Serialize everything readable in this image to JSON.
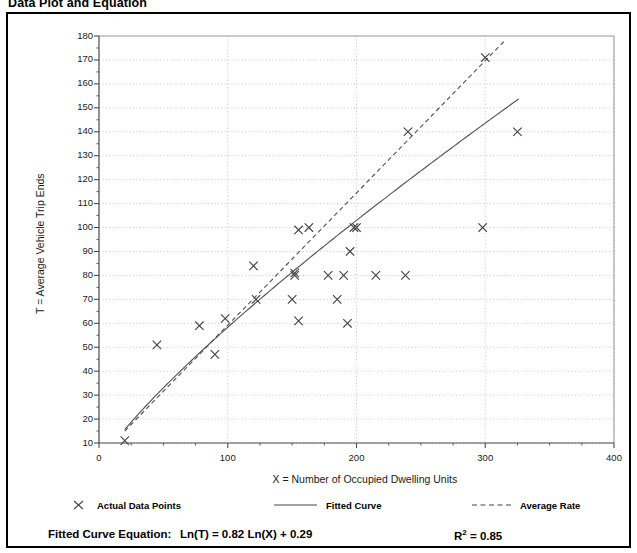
{
  "title": "Data Plot and Equation",
  "chart_data": {
    "type": "scatter",
    "title": "Data Plot and Equation",
    "xlabel": "X = Number of Occupied Dwelling Units",
    "ylabel": "T = Average Vehicle Trip Ends",
    "xlim": [
      0,
      400
    ],
    "ylim": [
      10,
      180
    ],
    "x_ticks": [
      0,
      100,
      200,
      300,
      400
    ],
    "x_minor_step": 25,
    "y_ticks": [
      10,
      20,
      30,
      40,
      50,
      60,
      70,
      80,
      90,
      100,
      110,
      120,
      130,
      140,
      150,
      160,
      170,
      180
    ],
    "y_minor_step": 5,
    "grid": "dotted-both",
    "legend_position": "below-plot",
    "series": [
      {
        "name": "Actual Data Points",
        "marker": "x",
        "points": [
          [
            20,
            11
          ],
          [
            45,
            51
          ],
          [
            78,
            59
          ],
          [
            90,
            47
          ],
          [
            98,
            62
          ],
          [
            120,
            84
          ],
          [
            122,
            70
          ],
          [
            150,
            70
          ],
          [
            152,
            81
          ],
          [
            152,
            80
          ],
          [
            155,
            99
          ],
          [
            163,
            100
          ],
          [
            155,
            61
          ],
          [
            178,
            80
          ],
          [
            185,
            70
          ],
          [
            190,
            80
          ],
          [
            193,
            60
          ],
          [
            195,
            90
          ],
          [
            198,
            100
          ],
          [
            200,
            100
          ],
          [
            215,
            80
          ],
          [
            238,
            80
          ],
          [
            240,
            140
          ],
          [
            298,
            100
          ],
          [
            300,
            171
          ],
          [
            325,
            140
          ]
        ]
      },
      {
        "name": "Fitted Curve",
        "style": "solid",
        "equation": "Ln(T) = 0.82 Ln(X) + 0.29",
        "a": 0.82,
        "b": 0.29
      },
      {
        "name": "Average Rate",
        "style": "dashed",
        "slope_points": [
          [
            20,
            15
          ],
          [
            315,
            178
          ]
        ]
      }
    ],
    "annotations": {
      "equation_label": "Fitted Curve Equation:",
      "equation": "Ln(T) = 0.82 Ln(X) + 0.29",
      "r_squared_label": "R",
      "r_squared_exponent": "2",
      "r_squared_value": "= 0.85"
    }
  },
  "legend": {
    "items": [
      {
        "label": "Actual Data Points",
        "marker": "x-marker"
      },
      {
        "label": "Fitted Curve",
        "marker": "solid-line"
      },
      {
        "label": "Average Rate",
        "marker": "dashed-line"
      }
    ]
  },
  "colors": {
    "border": "#000000",
    "grid": "#b9b9b9",
    "axis": "#4a4a4a",
    "curve": "#555555",
    "marker": "#444444",
    "text": "#000000"
  }
}
